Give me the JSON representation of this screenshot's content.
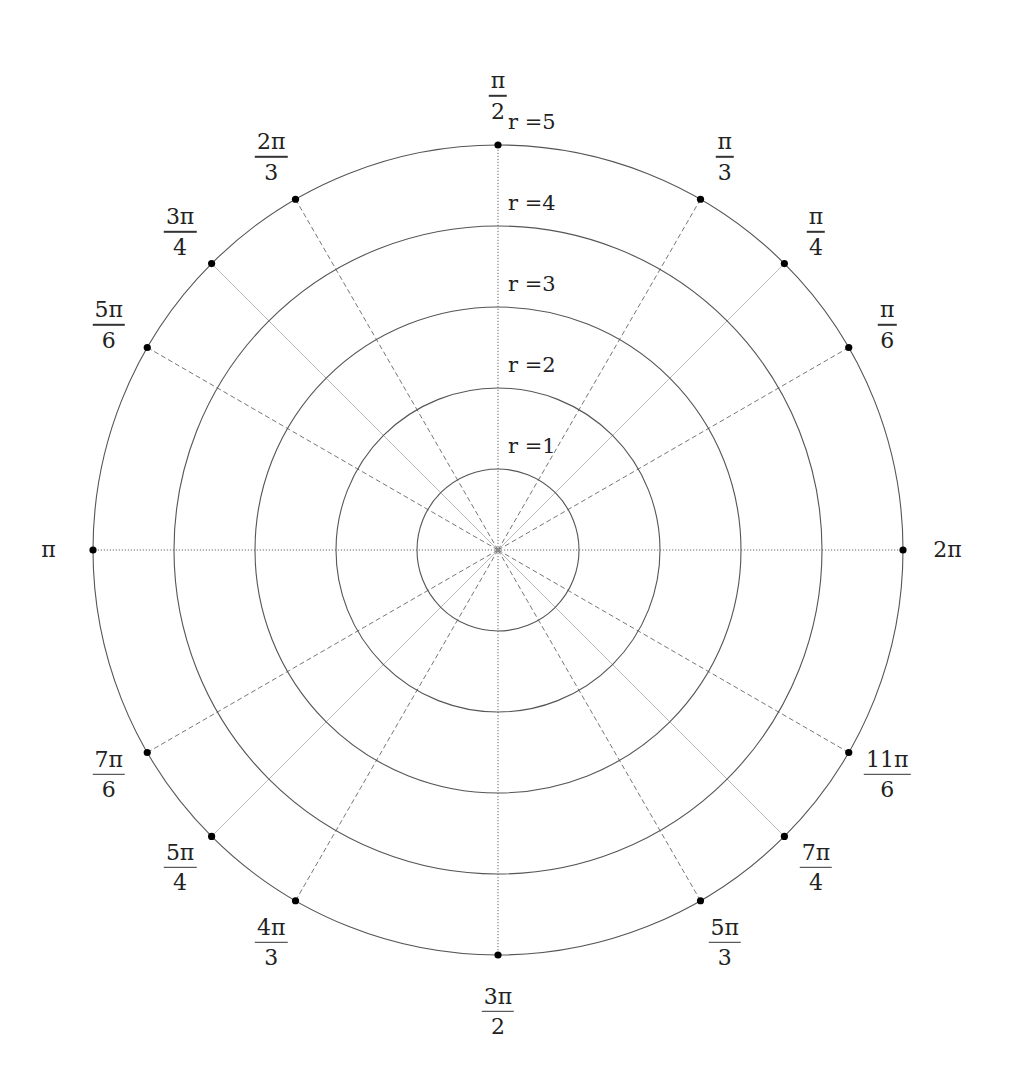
{
  "diagram": {
    "center": {
      "x": 498,
      "y": 550
    },
    "unit_px": 81,
    "colors": {
      "circle": "#555555",
      "spoke": "#777777",
      "spoke_light": "#bbbbbb",
      "dot": "#000000",
      "text": "#222222"
    },
    "circles": [
      {
        "r": 1,
        "label": "r =1"
      },
      {
        "r": 2,
        "label": "r =2"
      },
      {
        "r": 3,
        "label": "r =3"
      },
      {
        "r": 4,
        "label": "r =4"
      },
      {
        "r": 5,
        "label": "r =5"
      }
    ],
    "angles": [
      {
        "deg": 0,
        "num": "2π",
        "den": "",
        "style": "dotted",
        "label_r": 5.55
      },
      {
        "deg": 30,
        "num": "π",
        "den": "6",
        "style": "dashed",
        "label_r": 5.55
      },
      {
        "deg": 45,
        "num": "π",
        "den": "4",
        "style": "light",
        "label_r": 5.55
      },
      {
        "deg": 60,
        "num": "π",
        "den": "3",
        "style": "dashed",
        "label_r": 5.6
      },
      {
        "deg": 90,
        "num": "π",
        "den": "2",
        "style": "dotted",
        "label_r": 5.6
      },
      {
        "deg": 120,
        "num": "2π",
        "den": "3",
        "style": "dashed",
        "label_r": 5.6
      },
      {
        "deg": 135,
        "num": "3π",
        "den": "4",
        "style": "light",
        "label_r": 5.55
      },
      {
        "deg": 150,
        "num": "5π",
        "den": "6",
        "style": "dashed",
        "label_r": 5.55
      },
      {
        "deg": 180,
        "num": "π",
        "den": "",
        "style": "dotted",
        "label_r": 5.55
      },
      {
        "deg": 210,
        "num": "7π",
        "den": "6",
        "style": "dashed",
        "label_r": 5.55
      },
      {
        "deg": 225,
        "num": "5π",
        "den": "4",
        "style": "light",
        "label_r": 5.55
      },
      {
        "deg": 240,
        "num": "4π",
        "den": "3",
        "style": "dashed",
        "label_r": 5.6
      },
      {
        "deg": 270,
        "num": "3π",
        "den": "2",
        "style": "dotted",
        "label_r": 5.7
      },
      {
        "deg": 300,
        "num": "5π",
        "den": "3",
        "style": "dashed",
        "label_r": 5.6
      },
      {
        "deg": 315,
        "num": "7π",
        "den": "4",
        "style": "light",
        "label_r": 5.55
      },
      {
        "deg": 330,
        "num": "11π",
        "den": "6",
        "style": "dashed",
        "label_r": 5.55
      }
    ]
  }
}
